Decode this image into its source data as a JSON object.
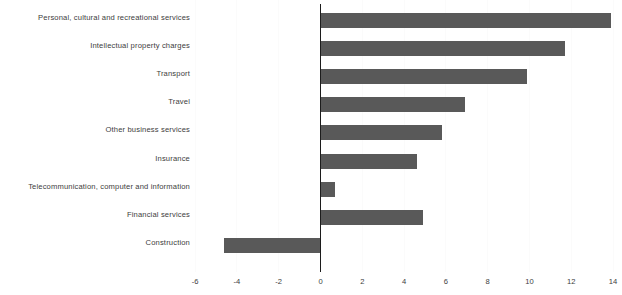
{
  "chart_data": {
    "type": "bar",
    "orientation": "horizontal",
    "title": "",
    "subtitle": "",
    "xlabel": "",
    "ylabel": "",
    "xlim": [
      -7,
      15
    ],
    "xticks": [
      -6,
      -4,
      -2,
      0,
      2,
      4,
      6,
      8,
      10,
      12,
      14
    ],
    "xticklabels": [
      "-6",
      "-4",
      "-2",
      "0",
      "2",
      "4",
      "6",
      "8",
      "10",
      "12",
      "14"
    ],
    "grid": true,
    "grid_axis": "x",
    "legend": false,
    "legend_position": "none",
    "zero_line": true,
    "bar_color": "#595959",
    "gridline_color": "#fbfbfb",
    "axis_color": "#1c1c1c",
    "categories": [
      "Personal, cultural and recreational services",
      "Intellectual property charges",
      "Transport",
      "Travel",
      "Other business services",
      "Insurance",
      "Telecommunication, computer and information",
      "Financial services",
      "Construction"
    ],
    "values": [
      13.9,
      11.7,
      9.9,
      6.9,
      5.8,
      4.6,
      0.7,
      4.9,
      -4.6
    ]
  }
}
